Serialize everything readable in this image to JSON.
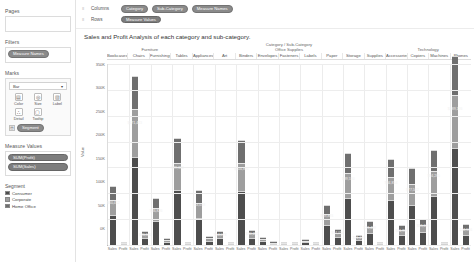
{
  "sidebar": {
    "pages_label": "Pages",
    "filters_label": "Filters",
    "filters_pill": "Measure Names",
    "marks_label": "Marks",
    "marks_type": "Bar",
    "marks_type_caret": "▾",
    "marks_buttons": [
      {
        "name": "color",
        "label": "Color",
        "glyph": "▤"
      },
      {
        "name": "size",
        "label": "Size",
        "glyph": "◎"
      },
      {
        "name": "label",
        "label": "Label",
        "glyph": "▧"
      },
      {
        "name": "detail",
        "label": "Detail",
        "glyph": "∴"
      },
      {
        "name": "tooltip",
        "label": "Tooltip",
        "glyph": "▢"
      }
    ],
    "color_pill": "Segment",
    "color_pill_glyph": "▤",
    "measure_values_label": "Measure Values",
    "measure_values_pills": [
      "SUM(Profit)",
      "SUM(Sales)"
    ],
    "legend_title": "Segment",
    "legend_items": [
      {
        "label": "Consumer",
        "color": "#4d4d4d"
      },
      {
        "label": "Corporate",
        "color": "#9e9e9e"
      },
      {
        "label": "Home Office",
        "color": "#6f6f6f"
      }
    ]
  },
  "shelves": {
    "columns_label": "Columns",
    "rows_label": "Rows",
    "caret": "≡",
    "columns_pills": [
      "Category",
      "Sub-Category",
      "Measure Names"
    ],
    "rows_pills": [
      "Measure Values"
    ]
  },
  "title": "Sales and Profit Analysis of each category and sub-category.",
  "chart_data": {
    "type": "bar",
    "title": "Sales and Profit Analysis of each category and sub-category.",
    "header_title": "Category / Sub-Category",
    "xlabel": "",
    "ylabel": "Value",
    "ylim": [
      0,
      350000
    ],
    "grid": true,
    "legend_position": "left-sidebar",
    "stacked": true,
    "ytick_labels": [
      "0K",
      "50K",
      "100K",
      "150K",
      "200K",
      "250K",
      "300K",
      "350K"
    ],
    "ytick_values": [
      0,
      50000,
      100000,
      150000,
      200000,
      250000,
      300000,
      350000
    ],
    "measure_labels": [
      "Sales",
      "Profit"
    ],
    "series": [
      {
        "name": "Consumer",
        "color": "#4d4d4d"
      },
      {
        "name": "Corporate",
        "color": "#9e9e9e"
      },
      {
        "name": "Home Office",
        "color": "#6f6f6f"
      }
    ],
    "categories": [
      {
        "name": "Furniture",
        "sub_categories": [
          {
            "name": "Bookcases",
            "sales": {
              "Consumer": 60000,
              "Corporate": 28000,
              "Home Office": 26000,
              "label": "$60,452"
            },
            "profit": {
              "Consumer": -1800,
              "Corporate": -1100,
              "Home Office": -800,
              "label": "-$3,473"
            }
          },
          {
            "name": "Chairs",
            "sales": {
              "Consumer": 171423,
              "Corporate": 92153,
              "Home Office": 64200,
              "label": "$171,423"
            },
            "profit": {
              "Consumer": 14000,
              "Corporate": 7500,
              "Home Office": 5000,
              "label": "$26,590"
            }
          },
          {
            "name": "Furnishings",
            "sales": {
              "Consumer": 48000,
              "Corporate": 25000,
              "Home Office": 18000,
              "label": "$46,826"
            },
            "profit": {
              "Consumer": 7000,
              "Corporate": 4000,
              "Home Office": 2400,
              "label": "$13,059"
            }
          },
          {
            "name": "Tables",
            "sales": {
              "Consumer": 107000,
              "Corporate": 52000,
              "Home Office": 47000,
              "label": "$99,374"
            },
            "profit": {
              "Consumer": -9000,
              "Corporate": -4500,
              "Home Office": -4000,
              "label": "-$17,725"
            }
          }
        ]
      },
      {
        "name": "Office Supplies",
        "sub_categories": [
          {
            "name": "Appliances",
            "sales": {
              "Consumer": 53000,
              "Corporate": 28000,
              "Home Office": 26000,
              "label": "$53,018"
            },
            "profit": {
              "Consumer": 9000,
              "Corporate": 5000,
              "Home Office": 4000,
              "label": "$18,138"
            }
          },
          {
            "name": "Art",
            "sales": {
              "Consumer": 14000,
              "Corporate": 7000,
              "Home Office": 6000,
              "label": "$14,078"
            },
            "profit": {
              "Consumer": 3000,
              "Corporate": 1500,
              "Home Office": 1200,
              "label": "$6,528"
            }
          },
          {
            "name": "Binders",
            "sales": {
              "Consumer": 105000,
              "Corporate": 55000,
              "Home Office": 43000,
              "label": "$104,881"
            },
            "profit": {
              "Consumer": 15000,
              "Corporate": 8000,
              "Home Office": 7000,
              "label": "$30,221"
            }
          },
          {
            "name": "Envelopes",
            "sales": {
              "Consumer": 8000,
              "Corporate": 4500,
              "Home Office": 3500,
              "label": "$8,077"
            },
            "profit": {
              "Consumer": 3500,
              "Corporate": 1800,
              "Home Office": 1500,
              "label": "$6,964"
            }
          },
          {
            "name": "Fasteners",
            "sales": {
              "Consumer": 1500,
              "Corporate": 900,
              "Home Office": 700,
              "label": "$1,500"
            },
            "profit": {
              "Consumer": 500,
              "Corporate": 250,
              "Home Office": 200,
              "label": "$950"
            }
          },
          {
            "name": "Labels",
            "sales": {
              "Consumer": 6000,
              "Corporate": 3200,
              "Home Office": 2400,
              "label": "$5,946"
            },
            "profit": {
              "Consumer": 2500,
              "Corporate": 1300,
              "Home Office": 1000,
              "label": "$5,546"
            }
          },
          {
            "name": "Paper",
            "sales": {
              "Consumer": 40000,
              "Corporate": 21000,
              "Home Office": 17000,
              "label": "$39,893"
            },
            "profit": {
              "Consumer": 16000,
              "Corporate": 8500,
              "Home Office": 6500,
              "label": "$34,054"
            }
          },
          {
            "name": "Storage",
            "sales": {
              "Consumer": 92000,
              "Corporate": 48000,
              "Home Office": 38000,
              "label": "$89,550"
            },
            "profit": {
              "Consumer": 10000,
              "Corporate": 5500,
              "Home Office": 4500,
              "label": "$21,279"
            }
          },
          {
            "name": "Supplies",
            "sales": {
              "Consumer": 24000,
              "Corporate": 12000,
              "Home Office": 10000,
              "label": "$23,439"
            },
            "profit": {
              "Consumer": -800,
              "Corporate": -400,
              "Home Office": -300,
              "label": "-$1,189"
            }
          }
        ]
      },
      {
        "name": "Technology",
        "sub_categories": [
          {
            "name": "Accessories",
            "sales": {
              "Consumer": 88000,
              "Corporate": 45000,
              "Home Office": 34000,
              "label": "$84,854"
            },
            "profit": {
              "Consumer": 20000,
              "Corporate": 10000,
              "Home Office": 8000,
              "label": "$41,937"
            }
          },
          {
            "name": "Copiers",
            "sales": {
              "Consumer": 78000,
              "Corporate": 40000,
              "Home Office": 31000,
              "label": "$77,562"
            },
            "profit": {
              "Consumer": 26000,
              "Corporate": 14000,
              "Home Office": 11000,
              "label": "$55,618"
            }
          },
          {
            "name": "Machines",
            "sales": {
              "Consumer": 96000,
              "Corporate": 48000,
              "Home Office": 40000,
              "label": "$94,265"
            },
            "profit": {
              "Consumer": 1800,
              "Corporate": 900,
              "Home Office": 700,
              "label": "$3,385"
            }
          },
          {
            "name": "Phones",
            "sales": {
              "Consumer": 189000,
              "Corporate": 101000,
              "Home Office": 75000,
              "label": "$189,126"
            },
            "profit": {
              "Consumer": 21000,
              "Corporate": 11000,
              "Home Office": 9000,
              "label": "$44,516"
            }
          }
        ]
      }
    ]
  }
}
